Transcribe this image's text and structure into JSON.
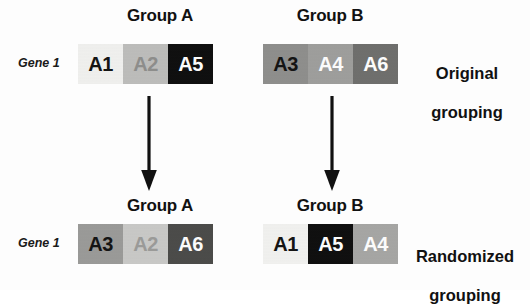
{
  "figure": {
    "background": "#fdfdfd",
    "ink": "#111111"
  },
  "rows": [
    {
      "id": "original",
      "caption": "Original\ngrouping",
      "caption_line1": "Original",
      "caption_line2": "grouping",
      "gene_label": "Gene 1",
      "groups": [
        {
          "name": "Group A",
          "cells": [
            {
              "label": "A1",
              "fill": "#f1f1ef",
              "text": "#141414"
            },
            {
              "label": "A2",
              "fill": "#bdbdbb",
              "text": "#8d8d8b"
            },
            {
              "label": "A5",
              "fill": "#0d0d0d",
              "text": "#fbfbfb"
            }
          ]
        },
        {
          "name": "Group B",
          "cells": [
            {
              "label": "A3",
              "fill": "#8e8e8c",
              "text": "#141414"
            },
            {
              "label": "A4",
              "fill": "#9e9e9c",
              "text": "#fbfbfb"
            },
            {
              "label": "A6",
              "fill": "#6e6e6c",
              "text": "#fbfbfb"
            }
          ]
        }
      ]
    },
    {
      "id": "randomized",
      "caption": "Randomized\ngrouping",
      "caption_line1": "Randomized",
      "caption_line2": "grouping",
      "gene_label": "Gene 1",
      "groups": [
        {
          "name": "Group A",
          "cells": [
            {
              "label": "A3",
              "fill": "#9a9a98",
              "text": "#141414"
            },
            {
              "label": "A2",
              "fill": "#c9c9c7",
              "text": "#9a9a98"
            },
            {
              "label": "A6",
              "fill": "#4a4a48",
              "text": "#fbfbfb"
            }
          ]
        },
        {
          "name": "Group B",
          "cells": [
            {
              "label": "A1",
              "fill": "#f2f2f0",
              "text": "#141414"
            },
            {
              "label": "A5",
              "fill": "#0d0d0d",
              "text": "#fbfbfb"
            },
            {
              "label": "A4",
              "fill": "#a6a6a4",
              "text": "#fbfbfb"
            }
          ]
        }
      ]
    }
  ],
  "arrows": [
    {
      "id": "arrow-group-a",
      "direction": "down"
    },
    {
      "id": "arrow-group-b",
      "direction": "down"
    }
  ]
}
